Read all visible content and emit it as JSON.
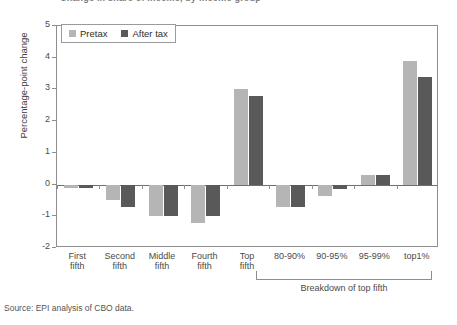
{
  "chart_data": {
    "type": "bar",
    "title": "Change in share of income, by income group",
    "ylabel": "Percentage-point change",
    "xlabel": "",
    "ylim": [
      -2,
      5
    ],
    "yticks": [
      5,
      4,
      3,
      2,
      1,
      0,
      -1,
      -2
    ],
    "grid": false,
    "legend_position": "top-left",
    "categories": [
      "First\nfifth",
      "Second\nfifth",
      "Middle\nfifth",
      "Fourth\nfifth",
      "Top\nfifth",
      "80-90%",
      "90-95%",
      "95-99%",
      "top1%"
    ],
    "series": [
      {
        "name": "Pretax",
        "color": "#b5b5b5",
        "values": [
          -0.1,
          -0.5,
          -1.0,
          -1.2,
          3.0,
          -0.7,
          -0.35,
          0.3,
          3.9
        ]
      },
      {
        "name": "After tax",
        "color": "#595959",
        "values": [
          -0.1,
          -0.7,
          -1.0,
          -1.0,
          2.8,
          -0.7,
          -0.15,
          0.3,
          3.4
        ]
      }
    ],
    "annotations": [
      {
        "name": "breakdown-bracket-label",
        "text": "Breakdown of top fifth",
        "covers": [
          "80-90%",
          "90-95%",
          "95-99%",
          "top1%"
        ]
      }
    ]
  },
  "legend": {
    "entries": [
      {
        "label": "Pretax"
      },
      {
        "label": "After tax"
      }
    ]
  },
  "source": {
    "text": "Source: EPI analysis of CBO data."
  },
  "breakdown": {
    "label": "Breakdown of top fifth"
  },
  "colors": {
    "pretax": "#b5b5b5",
    "after_tax": "#595959",
    "axis": "#8e8e8e",
    "text": "#4a4a4a"
  }
}
